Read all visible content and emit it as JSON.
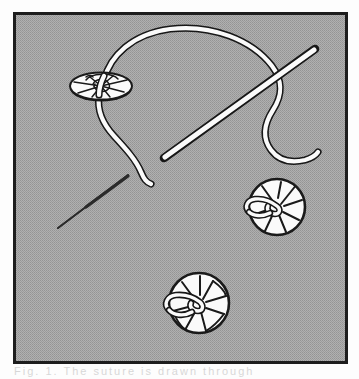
{
  "figure": {
    "kind": "line-illustration",
    "canvas": {
      "width": 359,
      "height": 379
    },
    "colors": {
      "page_background": "#fdfdfd",
      "panel_background": "#a8a8a8",
      "panel_halftone_dot": "#909090",
      "panel_border": "#1d1d1d",
      "ink": "#1a1a1a",
      "highlight_white": "#fafafa",
      "pin_dark": "#2b2b2b",
      "caption_faint": "#b9b9b9"
    },
    "panel": {
      "x": 13,
      "y": 12,
      "width": 335,
      "height": 352,
      "border_width": 3
    },
    "objects": [
      {
        "id": "thread",
        "label": "suture-thread",
        "description": "White arched suture thread outlined in black, entering the upper-left disc and trailing down-left and down-right"
      },
      {
        "id": "needle",
        "label": "straight-suture-needle",
        "description": "Long straight white needle outlined in black, running diagonally from lower-left to upper-right"
      },
      {
        "id": "pin",
        "label": "dark-tapered-pin",
        "description": "Small solid dark tapered pin in the lower-left region"
      },
      {
        "id": "disc-top-left",
        "label": "tissue-disc-edge-on",
        "description": "Flattened oval disc seen edge-on with radiating cracks, thread passing through its centre"
      },
      {
        "id": "disc-right",
        "label": "tissue-disc-right",
        "description": "Round disc with radiating cracks and a thread loop knotted at its centre"
      },
      {
        "id": "disc-bottom",
        "label": "tissue-disc-bottom",
        "description": "Round disc with radiating cracks and a thread loop knotted at its centre"
      }
    ],
    "caption": "Fig.  1.  The  suture  is  drawn  through"
  }
}
